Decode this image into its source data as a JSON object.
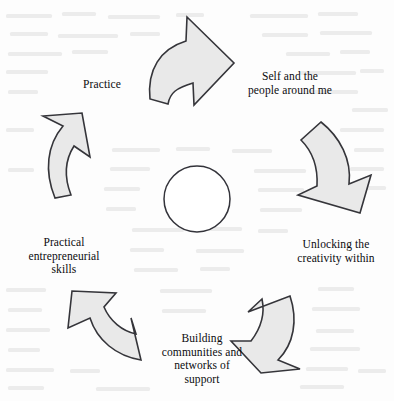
{
  "diagram": {
    "type": "cycle-diagram",
    "background_color": "#fdfdfd",
    "arrow_fill_color": "#e9e9e9",
    "arrow_stroke_color": "#35353a",
    "center": {
      "shape": "circle",
      "label": "",
      "fill_color": "#ffffff",
      "stroke_color": "#33333a"
    },
    "nodes": [
      {
        "id": "self-and-people",
        "label": "Self and the\npeople around me",
        "position": "top-right",
        "arrow_name": "arrow-top",
        "arrow_direction": "right-down"
      },
      {
        "id": "unlocking-creativity",
        "label": "Unlocking the\ncreativity within",
        "position": "right",
        "arrow_name": "arrow-right",
        "arrow_direction": "down-left"
      },
      {
        "id": "building-communities",
        "label": "Building\ncommunities and\nnetworks of\nsupport",
        "position": "bottom",
        "arrow_name": "arrow-bottom-right",
        "arrow_direction": "down-left"
      },
      {
        "id": "practical-entrepreneurial-skills",
        "label": "Practical\nentrepreneurial\nskills",
        "position": "left",
        "arrow_name": "arrow-bottom-left",
        "arrow_direction": "up-left"
      },
      {
        "id": "practice",
        "label": "Practice",
        "position": "top-left",
        "arrow_name": "arrow-left",
        "arrow_direction": "up-right"
      }
    ],
    "arrows": [
      {
        "name": "arrow-top",
        "direction": "right-down"
      },
      {
        "name": "arrow-right",
        "direction": "down-left"
      },
      {
        "name": "arrow-bottom-right",
        "direction": "down-left"
      },
      {
        "name": "arrow-bottom-left",
        "direction": "up-left"
      },
      {
        "name": "arrow-left",
        "direction": "up-right"
      }
    ]
  }
}
